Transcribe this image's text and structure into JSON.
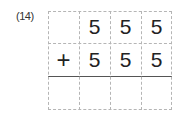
{
  "problem": {
    "label": "(14)",
    "rows": [
      [
        "",
        "5",
        "5",
        "5"
      ],
      [
        "+",
        "5",
        "5",
        "5"
      ],
      [
        "",
        "",
        "",
        ""
      ]
    ]
  }
}
